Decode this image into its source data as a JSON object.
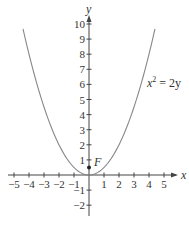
{
  "chart_data": {
    "type": "line",
    "title": "",
    "xlabel": "x",
    "ylabel": "y",
    "xlim": [
      -5.5,
      5.7
    ],
    "ylim": [
      -2.5,
      10.5
    ],
    "x_ticks": [
      -5,
      -4,
      -3,
      -2,
      -1,
      1,
      2,
      3,
      4,
      5
    ],
    "x_tick_labels": [
      "−5",
      "−4",
      "−3",
      "−2",
      "−1",
      "1",
      "2",
      "3",
      "4",
      "5"
    ],
    "y_ticks": [
      10,
      9,
      8,
      7,
      6,
      5,
      4,
      3,
      2,
      1,
      -1,
      -2
    ],
    "y_tick_labels": [
      "10",
      "9",
      "8",
      "7",
      "6",
      "5",
      "4",
      "3",
      "2",
      "1",
      "−1",
      "−2"
    ],
    "grid": false,
    "series": [
      {
        "name": "x^2 = 2y",
        "equation": "y = x^2 / 2",
        "x": [
          -4.4,
          -4,
          -3,
          -2,
          -1,
          0,
          1,
          2,
          3,
          4,
          4.4
        ],
        "values": [
          9.68,
          8,
          4.5,
          2,
          0.5,
          0,
          0.5,
          2,
          4.5,
          8,
          9.68
        ]
      }
    ],
    "points": [
      {
        "label": "F",
        "x": 0,
        "y": 0.5
      }
    ],
    "annotations": [
      {
        "text": "x² = 2y",
        "x": 4.7,
        "y": 6
      }
    ]
  },
  "labels": {
    "x_axis": "x",
    "y_axis": "y",
    "focus": "F",
    "equation_base": "x",
    "equation_exp": "2",
    "equation_rest": " = 2y"
  }
}
